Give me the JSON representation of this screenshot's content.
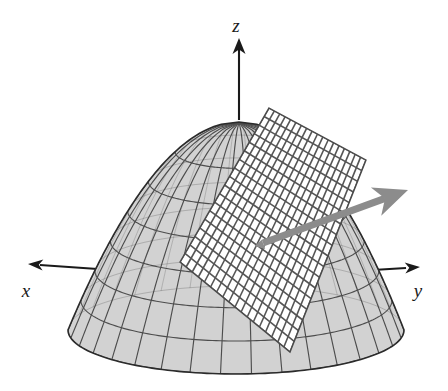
{
  "figure": {
    "background_color": "#ffffff",
    "width": 448,
    "height": 391
  },
  "axes": {
    "z": {
      "label": "z",
      "direction": "up",
      "arrowhead": "filled-triangle",
      "color": "#1a1a1a",
      "label_x": 236,
      "label_y": 32,
      "line_x1": 239,
      "line_y1": 120,
      "line_x2": 239,
      "line_y2": 48,
      "tip_x": 239,
      "tip_y": 38
    },
    "x": {
      "label": "x",
      "direction": "left",
      "arrowhead": "filled-triangle",
      "color": "#1a1a1a",
      "label_x": 26,
      "label_y": 297,
      "line_x1": 112,
      "line_y1": 270,
      "line_x2": 40,
      "line_y2": 265,
      "tip_x": 28,
      "tip_y": 264
    },
    "y": {
      "label": "y",
      "direction": "right",
      "arrowhead": "filled-triangle",
      "color": "#1a1a1a",
      "label_x": 418,
      "label_y": 297,
      "line_x1": 340,
      "line_y1": 272,
      "line_x2": 406,
      "line_y2": 268,
      "tip_x": 420,
      "tip_y": 267
    }
  },
  "surface": {
    "name": "paraboloid-dome",
    "fill_color": "#d2d2d2",
    "mesh_line_color": "#4d4d4d",
    "outline_color": "#2b2b2b",
    "apex_x": 239,
    "apex_y": 122,
    "base_center_x": 236,
    "base_center_y": 330,
    "base_rx": 168,
    "base_ry": 44,
    "u_lines": 17,
    "v_lines": 7
  },
  "tangent_plane": {
    "name": "tangent-plane-patch",
    "fill_color": "#ffffff",
    "grid_line_color": "#555555",
    "grid_cells_u": 18,
    "grid_cells_v": 18,
    "corners": [
      {
        "x": 269,
        "y": 108
      },
      {
        "x": 366,
        "y": 160
      },
      {
        "x": 290,
        "y": 352
      },
      {
        "x": 180,
        "y": 262
      }
    ]
  },
  "normal_vector": {
    "name": "normal-arrow",
    "color": "#8c8c8c",
    "shaft_width": 7,
    "tail_x": 263,
    "tail_y": 243,
    "tip_x": 408,
    "tip_y": 190,
    "arrowhead_length": 34,
    "arrowhead_half_width": 15
  }
}
